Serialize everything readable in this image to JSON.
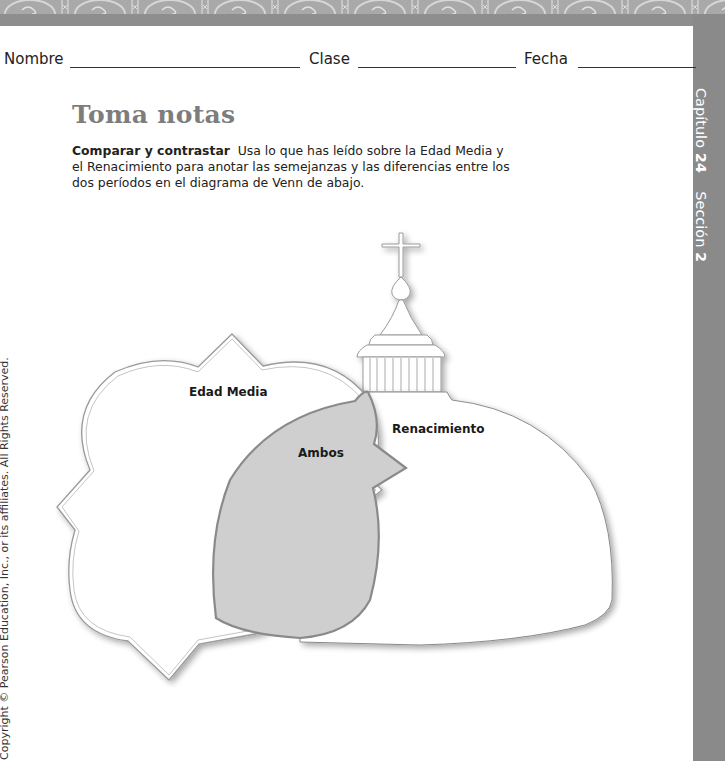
{
  "header": {
    "name_label": "Nombre",
    "class_label": "Clase",
    "date_label": "Fecha"
  },
  "side_tab": {
    "chapter_label": "Capítulo",
    "chapter_number": "24",
    "section_label": "Sección",
    "section_number": "2"
  },
  "title": "Toma notas",
  "instructions": {
    "lead": "Comparar y contrastar",
    "text": "Usa lo que has leído sobre la Edad Media y el Renacimiento para anotar las semejanzas y las diferencias entre los dos períodos en el diagrama de Venn de abajo."
  },
  "venn": {
    "left_label": "Edad Media",
    "right_label": "Renacimiento",
    "overlap_label": "Ambos",
    "overlap_color": "#cfcfcf",
    "outline_color": "#8a8a8a"
  },
  "copyright": "Copyright © Pearson Education, Inc., or its affiliates. All Rights Reserved."
}
